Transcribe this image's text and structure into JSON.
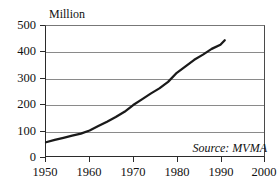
{
  "chart_data": {
    "type": "line",
    "title": "",
    "unit_label": "Million",
    "xlabel": "",
    "ylabel": "Million",
    "xlim": [
      1950,
      2000
    ],
    "ylim": [
      0,
      500
    ],
    "xticks": [
      1950,
      1960,
      1970,
      1980,
      1990,
      2000
    ],
    "yticks": [
      0,
      100,
      200,
      300,
      400,
      500
    ],
    "grid": true,
    "legend": "none",
    "annotations": [
      {
        "text": "Source: MVMA",
        "position": "bottom-right",
        "style": "italic"
      }
    ],
    "series": [
      {
        "name": "World Automobile Fleet",
        "color": "#1a1a1a",
        "x": [
          1950,
          1952,
          1954,
          1956,
          1958,
          1960,
          1962,
          1964,
          1966,
          1968,
          1970,
          1972,
          1974,
          1976,
          1978,
          1980,
          1982,
          1984,
          1986,
          1988,
          1990,
          1991
        ],
        "values": [
          53,
          62,
          70,
          78,
          86,
          98,
          115,
          132,
          150,
          170,
          196,
          218,
          240,
          260,
          285,
          320,
          345,
          370,
          390,
          412,
          428,
          445
        ]
      }
    ]
  },
  "axes": {
    "y_tick_labels": [
      "500",
      "400",
      "300",
      "200",
      "100",
      "0"
    ],
    "x_tick_labels": [
      "1950",
      "1960",
      "1970",
      "1980",
      "1990",
      "2000"
    ]
  },
  "source": {
    "text": "Source: MVMA"
  },
  "colors": {
    "line": "#1a1a1a",
    "grid": "#8a8a8a",
    "axis": "#2b2b2b",
    "background": "#ffffff",
    "text": "#111111"
  }
}
